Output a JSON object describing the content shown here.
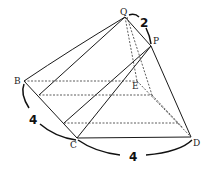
{
  "diagram": {
    "type": "geometry-solid",
    "points": {
      "Q": {
        "label": "Q",
        "x": 125,
        "y": 17
      },
      "P": {
        "label": "P",
        "x": 151,
        "y": 46
      },
      "B": {
        "label": "B",
        "x": 24,
        "y": 81
      },
      "E": {
        "label": "E",
        "x": 141,
        "y": 82
      },
      "C": {
        "label": "C",
        "x": 77,
        "y": 138
      },
      "D": {
        "label": "D",
        "x": 191,
        "y": 137
      }
    },
    "measurements": {
      "QP": "2",
      "BC": "4",
      "CD": "4"
    }
  }
}
